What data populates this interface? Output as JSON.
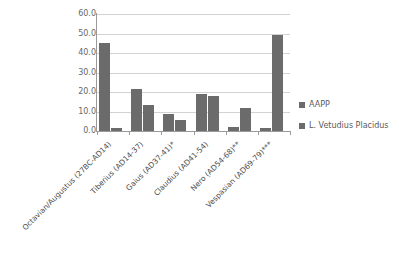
{
  "chart_data": {
    "type": "bar",
    "title": "",
    "subtitle": "",
    "xlabel": "",
    "ylabel": "",
    "ylim": [
      0,
      60
    ],
    "ytick_labels": [
      "60.0",
      "50.0",
      "40.0",
      "30.0",
      "20.0",
      "10.0",
      "0.0"
    ],
    "ytick_values": [
      60,
      50,
      40,
      30,
      20,
      10,
      0
    ],
    "grid": "horizontal",
    "legend_position": "right",
    "bar_color": "#6b6b6b",
    "grid_color": "#d2d2d2",
    "axis_color": "#9a9a9a",
    "background": "#ffffff",
    "categories": [
      "Octavian/Augustus (27BC-AD14)",
      "Tiberius (AD14-37)",
      "Gaius (AD37-41)*",
      "Claudius (AD41-54)",
      "Nero (AD54-68)**",
      "Vespasian (AD69-79)***"
    ],
    "series": [
      {
        "name": "AAPP",
        "values": [
          45.0,
          21.5,
          8.5,
          19.0,
          2.0,
          1.5
        ]
      },
      {
        "name": "L. Vetudius Placidus",
        "values": [
          1.5,
          13.5,
          5.5,
          18.0,
          12.0,
          49.0
        ]
      }
    ]
  },
  "legend": {
    "items": [
      {
        "label": "AAPP",
        "color": "#6b6b6b"
      },
      {
        "label": "L. Vetudius Placidus",
        "color": "#6b6b6b"
      }
    ]
  }
}
